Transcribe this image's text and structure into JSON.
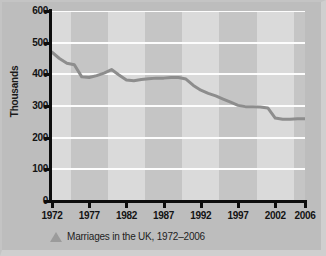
{
  "caption": {
    "marker_icon": "triangle-up-icon",
    "text": "Marriages in the UK, 1972–2006"
  },
  "chart_data": {
    "type": "line",
    "title": "Marriages in the UK, 1972–2006",
    "xlabel": "",
    "ylabel": "Thousands",
    "xlim": [
      1972,
      2006
    ],
    "ylim": [
      0,
      600
    ],
    "grid": "horizontal",
    "legend": "none",
    "y_ticks": [
      0,
      100,
      200,
      300,
      400,
      500,
      600
    ],
    "y_tick_labels": [
      "0",
      "100",
      "200",
      "300",
      "400",
      "500",
      "600"
    ],
    "x_ticks": [
      1972,
      1977,
      1982,
      1987,
      1992,
      1997,
      2002,
      2006
    ],
    "x_tick_labels": [
      "1972",
      "1977",
      "1982",
      "1987",
      "1992",
      "1997",
      "2002",
      "2006"
    ],
    "line_color": "#8d8d8d",
    "plot_background": "#dadada",
    "band_color": "#c5c5c5",
    "gridline_color": "#fdfdfd",
    "axis_color": "#0d0d0d",
    "series": [
      {
        "name": "Marriages in the UK",
        "units": "thousands",
        "x": [
          1972,
          1973,
          1974,
          1975,
          1976,
          1977,
          1978,
          1979,
          1980,
          1981,
          1982,
          1983,
          1984,
          1985,
          1986,
          1987,
          1988,
          1989,
          1990,
          1991,
          1992,
          1993,
          1994,
          1995,
          1996,
          1997,
          1998,
          1999,
          2000,
          2001,
          2002,
          2003,
          2004,
          2005,
          2006
        ],
        "values": [
          470,
          450,
          435,
          430,
          392,
          390,
          396,
          404,
          415,
          398,
          382,
          380,
          384,
          386,
          388,
          388,
          390,
          390,
          385,
          365,
          350,
          340,
          332,
          322,
          312,
          302,
          298,
          298,
          297,
          294,
          262,
          258,
          258,
          260,
          260
        ]
      }
    ]
  }
}
